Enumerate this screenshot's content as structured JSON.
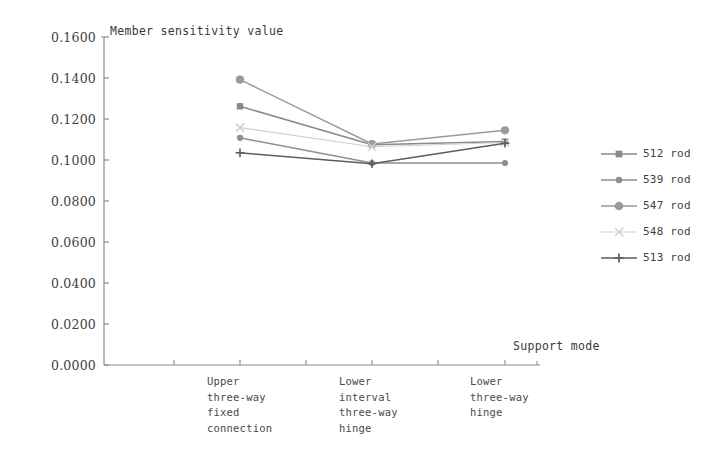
{
  "chart_data": {
    "type": "line",
    "title": "Member sensitivity value",
    "ylabel": "Member sensitivity value",
    "xlabel": "Support mode",
    "grid": false,
    "legend_position": "right",
    "ylim": [
      0.0,
      0.16
    ],
    "ytick_labels": [
      "0.1600",
      "0.1400",
      "0.1200",
      "0.1000",
      "0.0800",
      "0.0600",
      "0.0400",
      "0.0200",
      "0.0000"
    ],
    "ytick_values": [
      0.16,
      0.14,
      0.12,
      0.1,
      0.08,
      0.06,
      0.04,
      0.02,
      0.0
    ],
    "categories": [
      "Upper three-way fixed connection",
      "Lower interval three-way hinge",
      "Lower three-way hinge"
    ],
    "category_label_lines": [
      [
        "Upper",
        "three-way",
        "fixed",
        "connection"
      ],
      [
        "Lower",
        "interval",
        "three-way",
        "hinge"
      ],
      [
        "Lower",
        "three-way",
        "hinge"
      ]
    ],
    "series": [
      {
        "name": "512 rod",
        "marker": "square",
        "color": "#8a8a8a",
        "values": [
          0.1262,
          0.1075,
          0.109
        ]
      },
      {
        "name": "539 rod",
        "marker": "circle-small",
        "color": "#8e8e8e",
        "values": [
          0.1108,
          0.0985,
          0.0985
        ]
      },
      {
        "name": "547 rod",
        "marker": "circle-large",
        "color": "#9a9a9a",
        "values": [
          0.1392,
          0.1078,
          0.1145
        ]
      },
      {
        "name": "548 rod",
        "marker": "cross-x",
        "color": "#cfcfcf",
        "values": [
          0.1158,
          0.1065,
          0.1085
        ]
      },
      {
        "name": "513 rod",
        "marker": "plus",
        "color": "#5c5c5c",
        "values": [
          0.1035,
          0.0982,
          0.1082
        ]
      }
    ]
  },
  "legend": {
    "items": [
      {
        "label": "512 rod"
      },
      {
        "label": "539 rod"
      },
      {
        "label": "547 rod"
      },
      {
        "label": "548 rod"
      },
      {
        "label": "513 rod"
      }
    ]
  },
  "axes": {
    "y_axis_title": "Member sensitivity value",
    "x_axis_title": "Support mode"
  }
}
